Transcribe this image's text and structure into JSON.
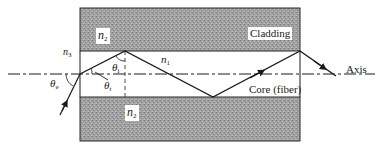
{
  "figure": {
    "type": "optical-fiber-ray-diagram",
    "colors": {
      "cladding_fill": "#9a9a9a",
      "line": "#1a1a1a",
      "background": "#ffffff"
    }
  },
  "labels": {
    "cladding_top_index": {
      "base": "n",
      "sub": "2"
    },
    "cladding_bottom_index": {
      "base": "n",
      "sub": "2"
    },
    "core_index": {
      "base": "n",
      "sub": "1"
    },
    "outside_index": {
      "base": "n",
      "sub": "3"
    },
    "theta_e": {
      "base": "θ",
      "sub": "e"
    },
    "theta_i": {
      "base": "θ",
      "sub": "i"
    },
    "theta_t": {
      "base": "θ",
      "sub": "t"
    },
    "cladding": "Cladding",
    "core": "Core (fiber)",
    "axis": "Axis"
  },
  "geometry": {
    "cladding_top": {
      "x": 80,
      "y": 8,
      "w": 220,
      "h": 43
    },
    "cladding_bottom": {
      "x": 80,
      "y": 97,
      "w": 220,
      "h": 44
    },
    "axis_y": 74,
    "ray_points": [
      [
        60,
        115
      ],
      [
        80,
        74
      ],
      [
        125,
        51
      ],
      [
        213,
        97
      ],
      [
        300,
        51
      ],
      [
        336,
        76
      ]
    ]
  }
}
